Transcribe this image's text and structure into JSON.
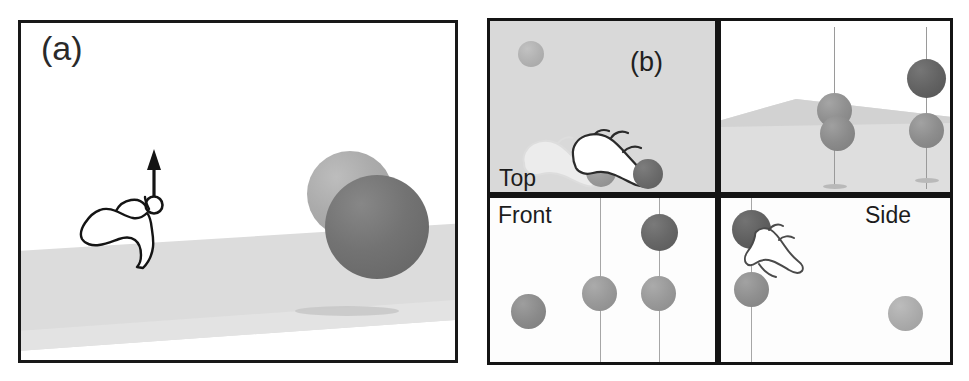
{
  "figure": {
    "caption_tags": {
      "a": "(a)",
      "b": "(b)"
    },
    "background_color": "#ffffff"
  },
  "panel_a": {
    "tag": "(a)",
    "name": "perspective-overview",
    "border_color": "#181818",
    "background_color": "#ffffff",
    "ground": {
      "name": "ground-plane",
      "color": "#dcdcdc",
      "shadow_color": "#c8c8c8"
    },
    "cursor": {
      "name": "pointing-hand-with-up-arrow",
      "stroke_color": "#141414",
      "fill_color": "#ffffff",
      "arrow_direction": "up",
      "gesture": "lift"
    },
    "spheres": [
      {
        "name": "sphere-light-ghost",
        "color": "#a8a8a8",
        "x": 290,
        "y": 152,
        "d": 86
      },
      {
        "name": "sphere-dark-active",
        "color": "#6f6f6f",
        "x": 310,
        "y": 172,
        "d": 102
      }
    ]
  },
  "grid": {
    "tag": "(b)",
    "cells": [
      {
        "key": "top",
        "label": "Top",
        "name": "top-view",
        "background_color": "#d9d9d9",
        "has_panel_tag": true,
        "panel_tag": "(b)",
        "spheres": [
          {
            "name": "sphere-gray-far",
            "color": "#b0b0b0",
            "x": 28,
            "y": 22,
            "d": 24
          },
          {
            "name": "sphere-gray-origin",
            "color": "#9a9a9a",
            "x": 99,
            "y": 140,
            "d": 28
          },
          {
            "name": "sphere-dark-target",
            "color": "#6a6a6a",
            "x": 145,
            "y": 142,
            "d": 28
          }
        ],
        "cursors": [
          {
            "name": "ghost-hand-cursor",
            "opacity": 0.45
          },
          {
            "name": "active-hand-cursor",
            "opacity": 1.0
          }
        ]
      },
      {
        "key": "perspective",
        "label": "",
        "name": "perspective-view",
        "background_color": "#ffffff",
        "ground_color": "#dedede",
        "dropline_color": "#9a9a9a",
        "spheres": [
          {
            "name": "sphere-mid-upper",
            "color": "#8e8e8e",
            "x": 96,
            "y": 76,
            "d": 34
          },
          {
            "name": "sphere-mid-lower",
            "color": "#8b8b8b",
            "x": 100,
            "y": 100,
            "d": 34
          },
          {
            "name": "sphere-dark-raised",
            "color": "#626262",
            "x": 186,
            "y": 42,
            "d": 38
          },
          {
            "name": "sphere-gray-grounded",
            "color": "#8d8d8d",
            "x": 186,
            "y": 96,
            "d": 34
          }
        ],
        "droplines": [
          {
            "name": "dropline-left",
            "x": 113,
            "top": 8,
            "height": 160
          },
          {
            "name": "dropline-right",
            "x": 205,
            "top": 8,
            "height": 160
          }
        ]
      },
      {
        "key": "front",
        "label": "Front",
        "name": "front-view",
        "background_color": "#fdfdfd",
        "dropline_color": "#a0a0a0",
        "spheres": [
          {
            "name": "sphere-gray-left",
            "color": "#8e8e8e",
            "x": 22,
            "y": 95,
            "d": 34
          },
          {
            "name": "sphere-gray-middle",
            "color": "#9b9b9b",
            "x": 93,
            "y": 80,
            "d": 34
          },
          {
            "name": "sphere-gray-right",
            "color": "#9b9b9b",
            "x": 152,
            "y": 80,
            "d": 34
          },
          {
            "name": "sphere-dark-right-top",
            "color": "#666666",
            "x": 152,
            "y": 18,
            "d": 36
          }
        ],
        "droplines": [
          {
            "name": "dropline-middle",
            "x": 110,
            "top": 0,
            "height": 164
          },
          {
            "name": "dropline-right",
            "x": 169,
            "top": 0,
            "height": 164
          }
        ]
      },
      {
        "key": "side",
        "label": "Side",
        "name": "side-view",
        "background_color": "#fdfdfd",
        "dropline_color": "#a0a0a0",
        "spheres": [
          {
            "name": "sphere-dark-top",
            "color": "#5e5e5e",
            "x": 12,
            "y": 14,
            "d": 38
          },
          {
            "name": "sphere-gray-below",
            "color": "#8f8f8f",
            "x": 14,
            "y": 76,
            "d": 34
          },
          {
            "name": "sphere-light-right",
            "color": "#acacac",
            "x": 168,
            "y": 100,
            "d": 34
          }
        ],
        "droplines": [
          {
            "name": "dropline-left",
            "x": 30,
            "top": 0,
            "height": 164
          }
        ],
        "cursor": {
          "name": "pointing-hand-cursor",
          "stroke_color": "#3a3a3a"
        }
      }
    ]
  }
}
